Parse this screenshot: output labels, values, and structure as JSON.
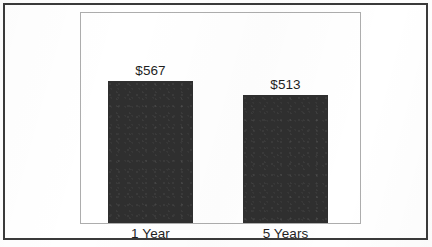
{
  "chart_data": {
    "type": "bar",
    "title": "",
    "subtitle": "",
    "xlabel": "",
    "ylabel": "",
    "categories": [
      "1 Year",
      "5 Years"
    ],
    "values": [
      567,
      513
    ],
    "value_labels": [
      "$567",
      "$513"
    ],
    "value_prefix": "$",
    "ylim": [
      0,
      840
    ],
    "grid": false,
    "legend": false,
    "legend_position": "none",
    "orientation": "vertical",
    "series": [
      {
        "name": "",
        "values": [
          567,
          513
        ],
        "color": "#2f2f2f"
      }
    ],
    "annotations": []
  },
  "style": {
    "bar_color": "#2f2f2f",
    "plot_border_color": "#adadad",
    "outer_border_color": "#3a3a3a",
    "text_color": "#1f1f1f",
    "background_color": "#ffffff"
  }
}
